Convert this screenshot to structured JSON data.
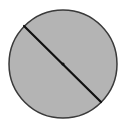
{
  "diagram": {
    "type": "circle-with-diameter",
    "circle": {
      "cx": 63,
      "cy": 64,
      "r": 54,
      "fill": "#b4b4b4",
      "stroke": "#3a3a3a"
    },
    "diameter": {
      "x1": 24,
      "y1": 26,
      "x2": 101,
      "y2": 102,
      "stroke": "#111111"
    },
    "center_point": {
      "cx": 63,
      "cy": 64,
      "r": 1.6,
      "fill": "#111111"
    }
  }
}
